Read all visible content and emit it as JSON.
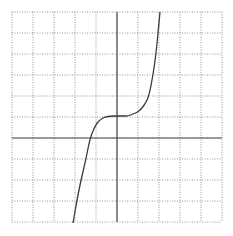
{
  "figure": {
    "grid": {
      "cells_x": 10,
      "cells_y": 10,
      "cell_size_px": 21,
      "origin_px": [
        12,
        12
      ],
      "line_style": "dotted",
      "line_color": "#8a8a8a"
    },
    "axes": {
      "x_axis_row": 6,
      "y_axis_col": 5,
      "color": "#4a4a4a"
    },
    "curve": {
      "color": "#3a3a3a",
      "shape": "cubic",
      "inflection_point_units": [
        0,
        1
      ],
      "points_px": [
        [
          73,
          223
        ],
        [
          77,
          200
        ],
        [
          81,
          180
        ],
        [
          86,
          159
        ],
        [
          90,
          138
        ],
        [
          96,
          124
        ],
        [
          101,
          119
        ],
        [
          105,
          117
        ],
        [
          111,
          116
        ],
        [
          117,
          116
        ],
        [
          123,
          116
        ],
        [
          128,
          116
        ],
        [
          133,
          114
        ],
        [
          138,
          112
        ],
        [
          142,
          108
        ],
        [
          145,
          104
        ],
        [
          149,
          96
        ],
        [
          153,
          75
        ],
        [
          156,
          54
        ],
        [
          158,
          33
        ],
        [
          160,
          12
        ]
      ]
    }
  }
}
